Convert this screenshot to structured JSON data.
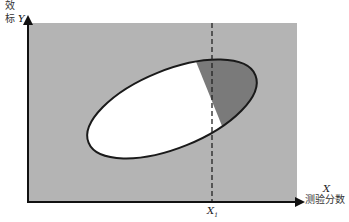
{
  "diagram": {
    "y_axis": {
      "label_cn_line1": "效",
      "label_cn_line2": "标",
      "label_symbol": "Y"
    },
    "x_axis": {
      "label_symbol": "X",
      "label_cn": "测验分数"
    },
    "cutoff": {
      "label": "X",
      "subscript": "1"
    },
    "colors": {
      "background_region": "#b4b4b4",
      "ellipse_fill": "#ffffff",
      "shaded_region": "#7a7a7a",
      "outline": "#1a1a1a"
    }
  }
}
